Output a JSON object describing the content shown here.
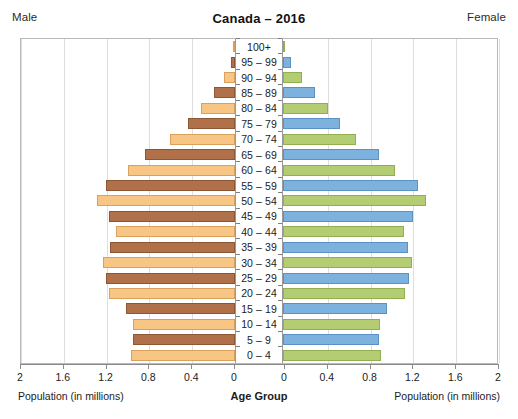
{
  "header": {
    "male_label": "Male",
    "female_label": "Female",
    "title": "Canada – 2016"
  },
  "axis": {
    "left_caption": "Population (in millions)",
    "right_caption": "Population (in millions)",
    "center_caption": "Age Group",
    "tick_labels_left": [
      "2",
      "1.6",
      "1.2",
      "0.8",
      "0.4",
      "0"
    ],
    "tick_labels_right": [
      "0",
      "0.4",
      "0.8",
      "1.2",
      "1.6",
      "2"
    ]
  },
  "colors": {
    "male_dark": "#b0714a",
    "male_light": "#f7c684",
    "female_blue": "#7cb2dd",
    "female_olive": "#b4cd73",
    "grid": "#dedede",
    "frame": "#b9b9b9"
  },
  "chart_data": {
    "type": "bar",
    "title": "Canada – 2016",
    "xlabel": "Population (in millions)",
    "ylabel": "Age Group",
    "xlim": [
      0,
      2
    ],
    "grid": true,
    "legend": [
      "Male",
      "Female"
    ],
    "legend_position": "top-left and top-right",
    "categories": [
      "100+",
      "95 – 99",
      "90 – 94",
      "85 – 89",
      "80 – 84",
      "75 – 79",
      "70 – 74",
      "65 – 69",
      "60 – 64",
      "55 – 59",
      "50 – 54",
      "45 – 49",
      "40 – 44",
      "35 – 39",
      "30 – 34",
      "25 – 29",
      "20 – 24",
      "15 – 19",
      "10 – 14",
      "5 – 9",
      "0 – 4"
    ],
    "series": [
      {
        "name": "Male",
        "values": [
          0.01,
          0.04,
          0.1,
          0.2,
          0.32,
          0.44,
          0.61,
          0.84,
          1.0,
          1.21,
          1.29,
          1.18,
          1.11,
          1.17,
          1.23,
          1.21,
          1.18,
          1.02,
          0.95,
          0.95,
          0.97
        ]
      },
      {
        "name": "Female",
        "values": [
          0.02,
          0.08,
          0.18,
          0.3,
          0.42,
          0.53,
          0.68,
          0.9,
          1.05,
          1.26,
          1.34,
          1.22,
          1.13,
          1.17,
          1.21,
          1.18,
          1.14,
          0.97,
          0.91,
          0.9,
          0.92
        ]
      }
    ]
  }
}
